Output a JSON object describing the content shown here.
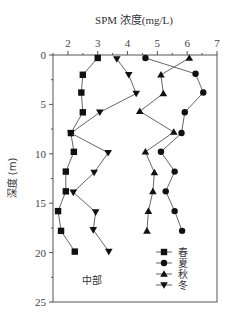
{
  "chart_data": {
    "type": "line",
    "title": "SPM 浓度(mg/L)",
    "xlabel": "SPM 浓度(mg/L)",
    "ylabel": "深度 (m)",
    "xlim": [
      1.5,
      7
    ],
    "ylim": [
      0,
      25
    ],
    "y_inverted": true,
    "x_axis_position": "top",
    "x_ticks": [
      2,
      3,
      4,
      5,
      6,
      7
    ],
    "y_ticks": [
      0,
      5,
      10,
      15,
      20,
      25
    ],
    "grid": false,
    "legend_position": "lower right (inside)",
    "annotation": "中部",
    "series": [
      {
        "name": "春",
        "marker": "square",
        "depth": [
          0.3,
          2.0,
          3.8,
          5.8,
          7.9,
          9.8,
          11.8,
          13.8,
          15.8,
          17.8,
          19.9
        ],
        "values": [
          3.0,
          2.5,
          2.45,
          2.5,
          2.1,
          2.2,
          1.93,
          1.93,
          1.67,
          1.77,
          2.23
        ]
      },
      {
        "name": "夏",
        "marker": "circle",
        "depth": [
          0.3,
          1.9,
          3.8,
          5.8,
          7.9,
          9.8,
          11.8,
          13.8,
          15.8,
          17.8
        ],
        "values": [
          4.6,
          6.28,
          6.54,
          5.92,
          5.81,
          5.12,
          5.58,
          5.28,
          5.58,
          5.83
        ]
      },
      {
        "name": "秋",
        "marker": "triangle-up",
        "depth": [
          0.3,
          2.0,
          3.9,
          5.7,
          7.8,
          9.8,
          11.9,
          13.8,
          15.8,
          17.8
        ],
        "values": [
          6.07,
          5.12,
          5.2,
          4.41,
          5.55,
          4.6,
          4.9,
          4.85,
          4.7,
          4.65
        ]
      },
      {
        "name": "冬",
        "marker": "triangle-down",
        "depth": [
          0.4,
          2.0,
          3.9,
          5.8,
          7.9,
          9.9,
          11.9,
          13.9,
          15.9,
          17.7,
          19.9
        ],
        "values": [
          3.64,
          4.04,
          4.29,
          3.07,
          2.1,
          3.35,
          2.88,
          2.18,
          2.93,
          2.85,
          3.37
        ]
      }
    ]
  },
  "labels": {
    "title": "SPM 浓度(mg/L)",
    "ylabel": "深度 (m)",
    "annotation": "中部",
    "x_tick_labels": [
      "2",
      "3",
      "4",
      "5",
      "6",
      "7"
    ],
    "y_tick_labels": [
      "0",
      "5",
      "10",
      "15",
      "20",
      "25"
    ],
    "legend": [
      "春",
      "夏",
      "秋",
      "冬"
    ]
  },
  "colors": {
    "axis": "#555555",
    "marker": "#111111",
    "line": "#555555",
    "background": "#ffffff"
  }
}
